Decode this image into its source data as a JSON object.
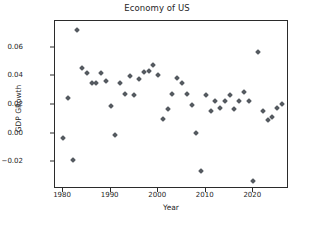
{
  "chart_data": {
    "type": "scatter",
    "title": "Economy of US",
    "xlabel": "Year",
    "ylabel": "GDP GRowth",
    "grid": false,
    "legend": null,
    "xlim": [
      1978.2,
      1978.2
    ],
    "xlim_actual": [
      1978.2,
      1979.0
    ],
    "x_axis": {
      "min": 1978.3,
      "max": 2027.5,
      "ticks": [
        1980,
        1990,
        2000,
        2010,
        2020
      ],
      "tick_labels": [
        "1980",
        "1990",
        "2000",
        "2010",
        "2020"
      ]
    },
    "y_axis": {
      "min": -0.0385,
      "max": 0.0785,
      "ticks": [
        -0.02,
        0.0,
        0.02,
        0.04,
        0.06
      ],
      "tick_labels": [
        "−0.02",
        "0.00",
        "0.02",
        "0.04",
        "0.06"
      ]
    },
    "marker": {
      "shape": "diamond",
      "color": "#555a60",
      "size": 4
    },
    "x": [
      1980,
      1981,
      1982,
      1983,
      1984,
      1985,
      1986,
      1987,
      1988,
      1989,
      1990,
      1991,
      1992,
      1993,
      1994,
      1995,
      1996,
      1997,
      1998,
      1999,
      2000,
      2001,
      2002,
      2003,
      2004,
      2005,
      2006,
      2007,
      2008,
      2009,
      2010,
      2011,
      2012,
      2013,
      2014,
      2015,
      2016,
      2017,
      2018,
      2019,
      2020,
      2021,
      2022,
      2023,
      2024,
      2025,
      2026
    ],
    "y": [
      -0.003,
      0.025,
      -0.018,
      0.072,
      0.046,
      0.042,
      0.035,
      0.035,
      0.042,
      0.037,
      0.019,
      -0.001,
      0.035,
      0.028,
      0.04,
      0.027,
      0.038,
      0.043,
      0.044,
      0.048,
      0.041,
      0.01,
      0.017,
      0.028,
      0.039,
      0.035,
      0.028,
      0.02,
      0.0005,
      -0.026,
      0.027,
      0.016,
      0.023,
      0.018,
      0.023,
      0.027,
      0.017,
      0.023,
      0.029,
      0.023,
      -0.033,
      0.057,
      0.016,
      0.0095,
      0.0115,
      0.018,
      0.021
    ],
    "series_name": "GDP Growth",
    "n_points": 47,
    "colors": {
      "marker": "#555a60",
      "axes": "#2b2b2b",
      "text": "#262626",
      "background": "#ffffff"
    }
  }
}
